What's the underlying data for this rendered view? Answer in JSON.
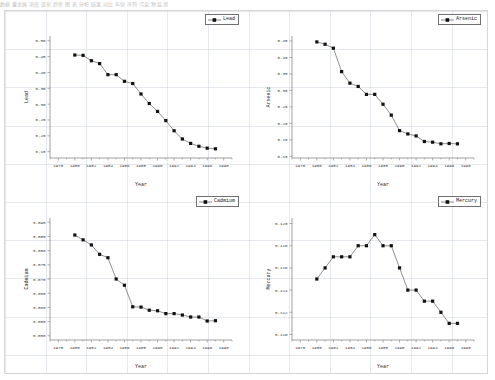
{
  "top_strip_text": "数据 重金属 浓度 变化 趋势 图 表 分析 结果 对比 年份 序列 污染 物 监测",
  "layout": {
    "rows": 2,
    "cols": 2,
    "background": "#ffffff",
    "grid_color": "#d0d6de",
    "border_color": "#d7d7d7"
  },
  "style": {
    "marker_color": "#111111",
    "line_color": "#555555",
    "axis_color": "#7a7a7a",
    "text_color": "#3a3a3a"
  },
  "chart_data": [
    {
      "id": "lead",
      "type": "line",
      "title": "",
      "legend_label": "Lead",
      "legend_position": "top-right",
      "xlabel": "Year",
      "ylabel": "Lead",
      "grid": true,
      "xlim": [
        1977,
        1999
      ],
      "ylim": [
        0.13,
        0.515
      ],
      "xticks": [
        1978,
        1980,
        1982,
        1984,
        1986,
        1988,
        1990,
        1992,
        1994,
        1996,
        1998
      ],
      "yticks": [
        0.5,
        0.45,
        0.4,
        0.35,
        0.3,
        0.25,
        0.2,
        0.15
      ],
      "ytick_labels": [
        "0.50",
        "0.45",
        "0.40",
        "0.35",
        "0.30",
        "0.25",
        "0.20",
        "0.15"
      ],
      "x": [
        1980,
        1981,
        1982,
        1983,
        1984,
        1985,
        1986,
        1987,
        1988,
        1989,
        1990,
        1991,
        1992,
        1993,
        1994,
        1995,
        1996,
        1997
      ],
      "y": [
        0.455,
        0.454,
        0.437,
        0.428,
        0.393,
        0.393,
        0.372,
        0.365,
        0.332,
        0.302,
        0.277,
        0.248,
        0.216,
        0.19,
        0.176,
        0.167,
        0.161,
        0.159
      ]
    },
    {
      "id": "arsenic",
      "type": "line",
      "title": "",
      "legend_label": "Arsenic",
      "legend_position": "top-right",
      "xlabel": "Year",
      "ylabel": "Arsenic",
      "grid": true,
      "xlim": [
        1977,
        1999
      ],
      "ylim": [
        0.095,
        0.465
      ],
      "xticks": [
        1978,
        1980,
        1982,
        1984,
        1986,
        1988,
        1990,
        1992,
        1994,
        1996,
        1998
      ],
      "yticks": [
        0.45,
        0.4,
        0.35,
        0.3,
        0.25,
        0.2,
        0.15,
        0.1
      ],
      "ytick_labels": [
        "0.45",
        "0.40",
        "0.35",
        "0.30",
        "0.25",
        "0.20",
        "0.15",
        "0.10"
      ],
      "x": [
        1980,
        1981,
        1982,
        1983,
        1984,
        1985,
        1986,
        1987,
        1988,
        1989,
        1990,
        1991,
        1992,
        1993,
        1994,
        1995,
        1996,
        1997
      ],
      "y": [
        0.447,
        0.44,
        0.428,
        0.357,
        0.322,
        0.312,
        0.288,
        0.288,
        0.258,
        0.225,
        0.178,
        0.168,
        0.162,
        0.145,
        0.143,
        0.138,
        0.139,
        0.138
      ]
    },
    {
      "id": "cadmium",
      "type": "line",
      "title": "",
      "legend_label": "Cadmium",
      "legend_position": "top-right",
      "xlabel": "Year",
      "ylabel": "Cadmium",
      "grid": true,
      "xlim": [
        1977,
        1999
      ],
      "ylim": [
        0.0485,
        0.0915
      ],
      "xticks": [
        1978,
        1980,
        1982,
        1984,
        1986,
        1988,
        1990,
        1992,
        1994,
        1996,
        1998
      ],
      "yticks": [
        0.09,
        0.085,
        0.08,
        0.075,
        0.07,
        0.065,
        0.06,
        0.055,
        0.05
      ],
      "ytick_labels": [
        "0.090",
        "0.085",
        "0.080",
        "0.075",
        "0.070",
        "0.065",
        "0.060",
        "0.055",
        "0.050"
      ],
      "x": [
        1980,
        1981,
        1982,
        1983,
        1984,
        1985,
        1986,
        1987,
        1988,
        1989,
        1990,
        1991,
        1992,
        1993,
        1994,
        1995,
        1996,
        1997
      ],
      "y": [
        0.0855,
        0.0838,
        0.082,
        0.0787,
        0.0775,
        0.07,
        0.0678,
        0.0602,
        0.0601,
        0.059,
        0.0588,
        0.0578,
        0.0578,
        0.0573,
        0.0566,
        0.0566,
        0.0552,
        0.0553
      ]
    },
    {
      "id": "mercury",
      "type": "line",
      "title": "",
      "legend_label": "Mercury",
      "legend_position": "top-right",
      "xlabel": "Year",
      "ylabel": "Mercury",
      "grid": true,
      "xlim": [
        1977,
        1999
      ],
      "ylim": [
        0.1095,
        0.1205
      ],
      "xticks": [
        1978,
        1980,
        1982,
        1984,
        1986,
        1988,
        1990,
        1992,
        1994,
        1996,
        1998
      ],
      "yticks": [
        0.12,
        0.118,
        0.116,
        0.114,
        0.112,
        0.11
      ],
      "ytick_labels": [
        "0.120",
        "0.118",
        "0.116",
        "0.114",
        "0.112",
        "0.110"
      ],
      "x": [
        1980,
        1981,
        1982,
        1983,
        1984,
        1985,
        1986,
        1987,
        1988,
        1989,
        1990,
        1991,
        1992,
        1993,
        1994,
        1995,
        1996,
        1997
      ],
      "y": [
        0.115,
        0.116,
        0.117,
        0.117,
        0.117,
        0.118,
        0.118,
        0.119,
        0.118,
        0.118,
        0.116,
        0.114,
        0.114,
        0.113,
        0.113,
        0.112,
        0.111,
        0.111
      ]
    }
  ]
}
